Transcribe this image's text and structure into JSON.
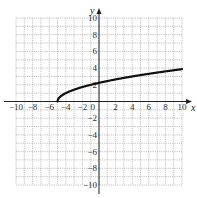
{
  "chart_data": {
    "type": "line",
    "title": "",
    "xlabel": "x",
    "ylabel": "y",
    "xlim": [
      -10,
      10
    ],
    "ylim": [
      -10,
      10
    ],
    "grid": true,
    "grid_step": 1,
    "x_ticks": [
      -10,
      -8,
      -6,
      -4,
      -2,
      0,
      2,
      4,
      6,
      8,
      10
    ],
    "y_ticks": [
      -10,
      -8,
      -6,
      -4,
      -2,
      2,
      4,
      6,
      8,
      10
    ],
    "x_tick_labels": [
      "−10",
      "−8",
      "−6",
      "−4",
      "−2",
      "0",
      "2",
      "4",
      "6",
      "8",
      "10"
    ],
    "y_tick_labels": [
      "−10",
      "−8",
      "−6",
      "−4",
      "−2",
      "2",
      "4",
      "6",
      "8",
      "10"
    ],
    "series": [
      {
        "name": "y = √(x + 5)",
        "x": [
          -5,
          -4.75,
          -4.5,
          -4,
          -3,
          -2,
          -1,
          0,
          1,
          2,
          3,
          4,
          5,
          6,
          7,
          8,
          9,
          10
        ],
        "values": [
          0,
          0.5,
          0.71,
          1,
          1.41,
          1.73,
          2,
          2.24,
          2.45,
          2.65,
          2.83,
          3,
          3.16,
          3.32,
          3.46,
          3.61,
          3.74,
          3.87
        ]
      }
    ],
    "colors": {
      "curve": "#111111",
      "grid": "#9a9a9a",
      "axis": "#222222"
    }
  }
}
